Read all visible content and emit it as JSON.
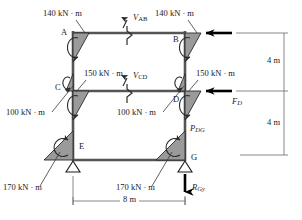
{
  "figure": {
    "colors": {
      "member": "#555555",
      "shade": "#9a9a9a",
      "outline": "#1a1a1a",
      "arrow": "#000000",
      "dimension": "#6b6b6b"
    }
  },
  "joints": [
    {
      "id": "A",
      "label": "A"
    },
    {
      "id": "B",
      "label": "B"
    },
    {
      "id": "C",
      "label": "C"
    },
    {
      "id": "D",
      "label": "D"
    },
    {
      "id": "E",
      "label": "E"
    },
    {
      "id": "G",
      "label": "G"
    }
  ],
  "moments": [
    {
      "id": "moment-a-top",
      "value": "140 kN · m",
      "joint": "A"
    },
    {
      "id": "moment-b-top",
      "value": "140 kN · m",
      "joint": "B"
    },
    {
      "id": "moment-c-upper",
      "value": "150 kN · m",
      "joint": "C"
    },
    {
      "id": "moment-d-upper",
      "value": "150 kN · m",
      "joint": "D"
    },
    {
      "id": "moment-c-lower",
      "value": "100 kN · m",
      "joint": "C"
    },
    {
      "id": "moment-d-lower",
      "value": "100 kN · m",
      "joint": "D"
    },
    {
      "id": "moment-e-base",
      "value": "170 kN · m",
      "joint": "E"
    },
    {
      "id": "moment-g-base",
      "value": "170 kN · m",
      "joint": "G"
    }
  ],
  "forces": [
    {
      "id": "shear-ab",
      "symbol": "V",
      "subscript": "AB",
      "kind": "shear-cut"
    },
    {
      "id": "shear-cd",
      "symbol": "V",
      "subscript": "CD",
      "kind": "shear-cut"
    },
    {
      "id": "force-d",
      "symbol": "F",
      "subscript": "D",
      "kind": "lateral-load"
    },
    {
      "id": "axial-dg",
      "symbol": "P",
      "subscript": "DG",
      "kind": "axial"
    },
    {
      "id": "reaction-gy",
      "symbol": "R",
      "subscript": "Gy",
      "kind": "reaction"
    }
  ],
  "dimensions": [
    {
      "id": "dim-upper-story",
      "value": "4 m",
      "orientation": "vertical"
    },
    {
      "id": "dim-lower-story",
      "value": "4 m",
      "orientation": "vertical"
    },
    {
      "id": "dim-span",
      "value": "8 m",
      "orientation": "horizontal"
    }
  ]
}
